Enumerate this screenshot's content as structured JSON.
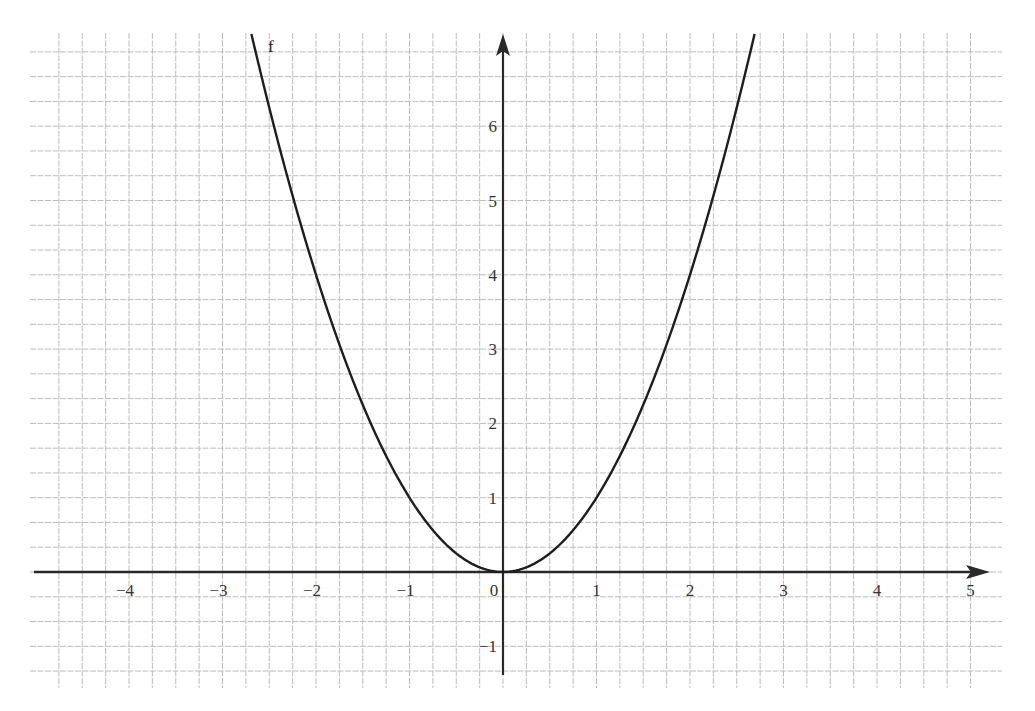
{
  "chart_data": {
    "type": "line",
    "title": "",
    "xlabel": "",
    "ylabel": "",
    "function_label": "f",
    "function": "f(x) = x^2",
    "xlim": [
      -4.9,
      5
    ],
    "ylim": [
      -1.5,
      7.3
    ],
    "grid": true,
    "grid_subdivisions": {
      "x_cells_per_unit": 4,
      "y_cells_per_unit": 3
    },
    "x_ticks": [
      "−4",
      "−3",
      "−2",
      "−1",
      "0",
      "1",
      "2",
      "3",
      "4",
      "5"
    ],
    "x_tick_values": [
      -4,
      -3,
      -2,
      -1,
      0,
      1,
      2,
      3,
      4,
      5
    ],
    "y_ticks": [
      "6",
      "5",
      "4",
      "3",
      "2",
      "1",
      "−1"
    ],
    "y_tick_values": [
      6,
      5,
      4,
      3,
      2,
      1,
      -1
    ],
    "series": [
      {
        "name": "f",
        "x": [
          -2.7,
          -2.5,
          -2,
          -1.5,
          -1,
          -0.5,
          0,
          0.5,
          1,
          1.5,
          2,
          2.5,
          2.7
        ],
        "y": [
          7.29,
          6.25,
          4,
          2.25,
          1,
          0.25,
          0,
          0.25,
          1,
          2.25,
          4,
          6.25,
          7.29
        ]
      }
    ],
    "colors": {
      "grid": "#bdbdbd",
      "axis": "#2a2a2a",
      "curve": "#1e1e1e",
      "background": "#ffffff"
    }
  }
}
